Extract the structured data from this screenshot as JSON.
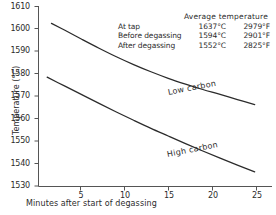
{
  "chart_data": {
    "type": "line",
    "title": "",
    "xlabel": "Minutes after start of degassing",
    "ylabel": "Temperature (°C)",
    "xlim": [
      0,
      27
    ],
    "ylim": [
      1530,
      1610
    ],
    "xticks": [
      5,
      10,
      15,
      20,
      25
    ],
    "yticks": [
      1530,
      1540,
      1550,
      1560,
      1570,
      1580,
      1590,
      1600,
      1610
    ],
    "grid": false,
    "legend_position": "inline-curve-labels",
    "series": [
      {
        "name": "Low carbon",
        "x": [
          1.5,
          3,
          5,
          7,
          9,
          11,
          13,
          15,
          17,
          19,
          21,
          23,
          25
        ],
        "values": [
          1602.5,
          1599.5,
          1595.4,
          1591.4,
          1587.6,
          1584.1,
          1580.9,
          1578.0,
          1575.4,
          1573.0,
          1570.8,
          1568.5,
          1566.3
        ]
      },
      {
        "name": "High carbon",
        "x": [
          1.0,
          3,
          5,
          7,
          9,
          11,
          13,
          15,
          17,
          19,
          21,
          23,
          25
        ],
        "values": [
          1578.5,
          1574.6,
          1570.7,
          1566.8,
          1563.0,
          1559.3,
          1555.7,
          1552.3,
          1548.9,
          1545.6,
          1542.4,
          1539.3,
          1536.3
        ]
      }
    ],
    "annotation_table": {
      "header": "Average temperature",
      "columns": [
        "",
        "°C",
        "°F"
      ],
      "rows": [
        {
          "label": "At tap",
          "celsius": "1637°C",
          "fahrenheit": "2979°F"
        },
        {
          "label": "Before degassing",
          "celsius": "1594°C",
          "fahrenheit": "2901°F"
        },
        {
          "label": "After degassing",
          "celsius": "1552°C",
          "fahrenheit": "2825°F"
        }
      ]
    },
    "curve_labels": [
      "Low carbon",
      "High carbon"
    ],
    "colors": {
      "axis": "#4a4a4a",
      "curve": "#2b2b2b",
      "text": "#2b2b2b",
      "background": "#ffffff"
    }
  },
  "axes": {
    "y_tick_labels": [
      "1610",
      "1600",
      "1590",
      "1580",
      "1570",
      "1560",
      "1550",
      "1540",
      "1530"
    ],
    "x_tick_labels": [
      "5",
      "10",
      "15",
      "20",
      "25"
    ],
    "y_axis_title": "Temperature (°C)",
    "x_axis_title": "Minutes after start of degassing"
  },
  "annotations": {
    "header": "Average temperature",
    "row1_label": "At tap",
    "row1_c": "1637°C",
    "row1_f": "2979°F",
    "row2_label": "Before degassing",
    "row2_c": "1594°C",
    "row2_f": "2901°F",
    "row3_label": "After degassing",
    "row3_c": "1552°C",
    "row3_f": "2825°F",
    "curve_low": "Low carbon",
    "curve_high": "High carbon"
  }
}
